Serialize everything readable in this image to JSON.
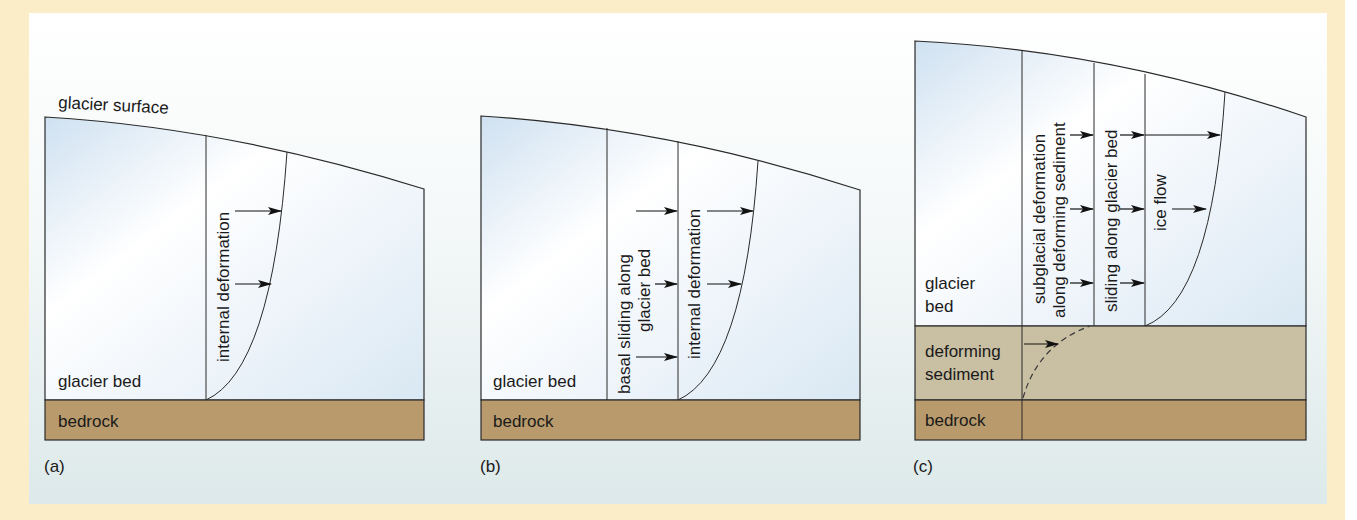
{
  "colors": {
    "frame": "#fbedc8",
    "ice_top": "#ffffff",
    "ice_bottom": "#d9e8f3",
    "bedrock": "#b89a6c",
    "deforming_sediment": "#c9bfa3",
    "line": "#2a2a2a"
  },
  "panel_a": {
    "caption": "(a)",
    "surface_label": "glacier surface",
    "bed_label": "glacier bed",
    "bedrock_label": "bedrock",
    "profile_label": "internal deformation"
  },
  "panel_b": {
    "caption": "(b)",
    "bed_label": "glacier bed",
    "bedrock_label": "bedrock",
    "sliding_label_line1": "basal sliding along",
    "sliding_label_line2": "glacier bed",
    "profile_label": "internal deformation"
  },
  "panel_c": {
    "caption": "(c)",
    "bed_label_line1": "glacier",
    "bed_label_line2": "bed",
    "sediment_label_line1": "deforming",
    "sediment_label_line2": "sediment",
    "bedrock_label": "bedrock",
    "subglacial_label_line1": "subglacial deformation",
    "subglacial_label_line2": "along deforming sediment",
    "sliding_label": "sliding along glacier bed",
    "flow_label": "ice flow"
  }
}
